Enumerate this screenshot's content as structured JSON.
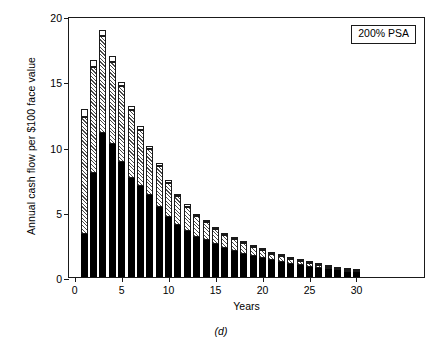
{
  "chart_data": {
    "type": "bar",
    "stacked": true,
    "title": "",
    "subtitle": "",
    "xlabel": "Years",
    "ylabel": "Annual cash flow per $100 face value",
    "xlim": [
      -0.6,
      37.4
    ],
    "ylim": [
      0,
      20
    ],
    "xticks": [
      0,
      5,
      10,
      15,
      20,
      25,
      30
    ],
    "yticks": [
      0,
      5,
      10,
      15,
      20
    ],
    "grid": false,
    "legend_position": "top-right",
    "legend_entries": [
      "200% PSA"
    ],
    "annotations": [
      "(d)"
    ],
    "caption": "(d)",
    "x": [
      1,
      2,
      3,
      4,
      5,
      6,
      7,
      8,
      9,
      10,
      11,
      12,
      13,
      14,
      15,
      16,
      17,
      18,
      19,
      20,
      21,
      22,
      23,
      24,
      25,
      26,
      27,
      28,
      29,
      30
    ],
    "categories": [
      "1",
      "2",
      "3",
      "4",
      "5",
      "6",
      "7",
      "8",
      "9",
      "10",
      "11",
      "12",
      "13",
      "14",
      "15",
      "16",
      "17",
      "18",
      "19",
      "20",
      "21",
      "22",
      "23",
      "24",
      "25",
      "26",
      "27",
      "28",
      "29",
      "30"
    ],
    "series": [
      {
        "name": "principal-black",
        "fill": "black",
        "values": [
          3.3,
          8.0,
          11.0,
          10.2,
          8.8,
          7.6,
          7.0,
          6.3,
          5.4,
          4.6,
          4.0,
          3.5,
          3.1,
          2.8,
          2.5,
          2.2,
          2.0,
          1.8,
          1.6,
          1.45,
          1.3,
          1.15,
          1.0,
          0.9,
          0.8,
          0.7,
          0.6,
          0.5,
          0.42,
          0.35
        ]
      },
      {
        "name": "interest-hatched",
        "fill": "hatched",
        "values": [
          9.0,
          8.1,
          7.5,
          6.3,
          5.8,
          5.2,
          4.3,
          3.5,
          3.1,
          2.6,
          2.2,
          1.9,
          1.6,
          1.4,
          1.2,
          1.05,
          0.9,
          0.8,
          0.7,
          0.6,
          0.5,
          0.45,
          0.4,
          0.35,
          0.3,
          0.25,
          0.2,
          0.15,
          0.1,
          0.08
        ]
      },
      {
        "name": "residual-white",
        "fill": "white",
        "values": [
          0.6,
          0.5,
          0.45,
          0.4,
          0.35,
          0.3,
          0.28,
          0.25,
          0.22,
          0.2,
          0.18,
          0.16,
          0.14,
          0.12,
          0.11,
          0.1,
          0.09,
          0.08,
          0.07,
          0.06,
          0.05,
          0.05,
          0.04,
          0.04,
          0.03,
          0.03,
          0.02,
          0.02,
          0.02,
          0.01
        ]
      }
    ],
    "totals": [
      12.9,
      16.6,
      18.95,
      16.9,
      14.95,
      13.1,
      11.58,
      10.05,
      8.72,
      7.4,
      6.38,
      5.56,
      4.84,
      4.32,
      3.81,
      3.35,
      2.99,
      2.68,
      2.37,
      2.11,
      1.85,
      1.65,
      1.44,
      1.29,
      1.13,
      0.98,
      0.82,
      0.67,
      0.54,
      0.44
    ]
  },
  "chart": {
    "ylabel": "Annual cash flow per $100 face value",
    "xlabel": "Years",
    "caption": "(d)",
    "legend_label": "200% PSA",
    "ytick_labels": [
      "0",
      "5",
      "10",
      "15",
      "20"
    ],
    "xtick_labels": [
      "0",
      "5",
      "10",
      "15",
      "20",
      "25",
      "30"
    ]
  },
  "colors": {
    "axis": "#1a1a1a",
    "black_segment": "#000000",
    "hatch_line": "#4a4a4a",
    "white_segment": "#ffffff",
    "background": "#ffffff"
  }
}
